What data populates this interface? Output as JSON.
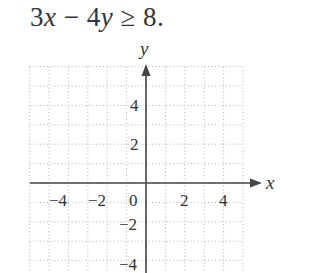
{
  "problem": {
    "inequality_parts": [
      "3",
      "x",
      " − ",
      "4",
      "y",
      " ≥ ",
      "8",
      "."
    ],
    "inequality_text": "3x − 4y ≥ 8."
  },
  "graph": {
    "x_axis_label": "x",
    "y_axis_label": "y",
    "x_tick_labels": [
      "−4",
      "−2",
      "0",
      "2",
      "4"
    ],
    "y_tick_labels": [
      "4",
      "2",
      "−2",
      "−4"
    ],
    "x_range": [
      -6,
      5
    ],
    "y_range": [
      -4.6,
      6
    ],
    "grid": "dotted",
    "grid_step": 1,
    "axis_color": "#444444",
    "grid_color": "#b0b0b0"
  }
}
